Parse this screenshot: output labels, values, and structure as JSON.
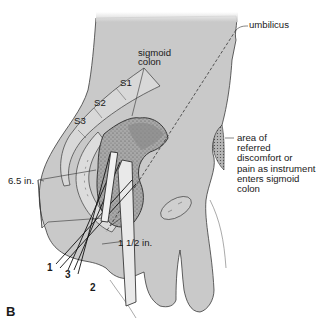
{
  "figure": {
    "panel_letter": "B",
    "colors": {
      "body_fill": "#c9c9c9",
      "colon_fill": "#9a9a9a",
      "outline": "#3a3a3a",
      "text": "#1a1a1a",
      "background": "#ffffff"
    }
  },
  "labels": {
    "umbilicus": "umbilicus",
    "sigmoid_colon_line1": "sigmoid",
    "sigmoid_colon_line2": "colon",
    "s1": "S1",
    "s2": "S2",
    "s3": "S3",
    "distance_6_5": "6.5 in.",
    "distance_1_5": "1 1/2 in.",
    "referred_area": [
      "area of",
      "referred",
      "discomfort or",
      "pain as instrument",
      "enters sigmoid",
      "colon"
    ],
    "instrument_1": "1",
    "instrument_2": "2",
    "instrument_3": "3"
  }
}
